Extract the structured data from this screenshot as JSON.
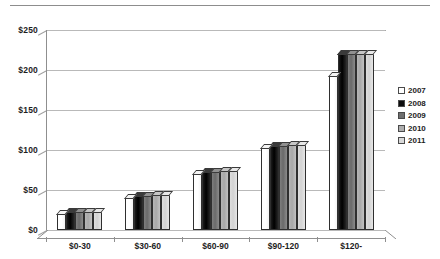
{
  "chart_data": {
    "type": "bar",
    "title": "",
    "subtitle": "",
    "xlabel": "",
    "ylabel": "",
    "ylim": [
      0,
      250
    ],
    "ytick_labels": [
      "$0",
      "$50",
      "$100",
      "$150",
      "$200",
      "$250"
    ],
    "ytick_values": [
      0,
      50,
      100,
      150,
      200,
      250
    ],
    "grid": true,
    "legend_position": "right",
    "categories": [
      "$0-30",
      "$30-60",
      "$60-90",
      "$90-120",
      "$120-"
    ],
    "series": [
      {
        "name": "2007",
        "color": "#ffffff",
        "values": [
          20,
          40,
          70,
          103,
          193
        ]
      },
      {
        "name": "2008",
        "color": "#0d0d0d",
        "values": [
          22,
          43,
          72,
          105,
          220
        ]
      },
      {
        "name": "2009",
        "color": "#6f6f6f",
        "values": [
          22,
          43,
          73,
          105,
          220
        ]
      },
      {
        "name": "2010",
        "color": "#aeaeae",
        "values": [
          22,
          44,
          74,
          106,
          220
        ]
      },
      {
        "name": "2011",
        "color": "#d9d9d9",
        "values": [
          23,
          44,
          74,
          106,
          220
        ]
      }
    ]
  },
  "legend": {
    "items": [
      {
        "label": "2007"
      },
      {
        "label": "2008"
      },
      {
        "label": "2009"
      },
      {
        "label": "2010"
      },
      {
        "label": "2011"
      }
    ]
  }
}
